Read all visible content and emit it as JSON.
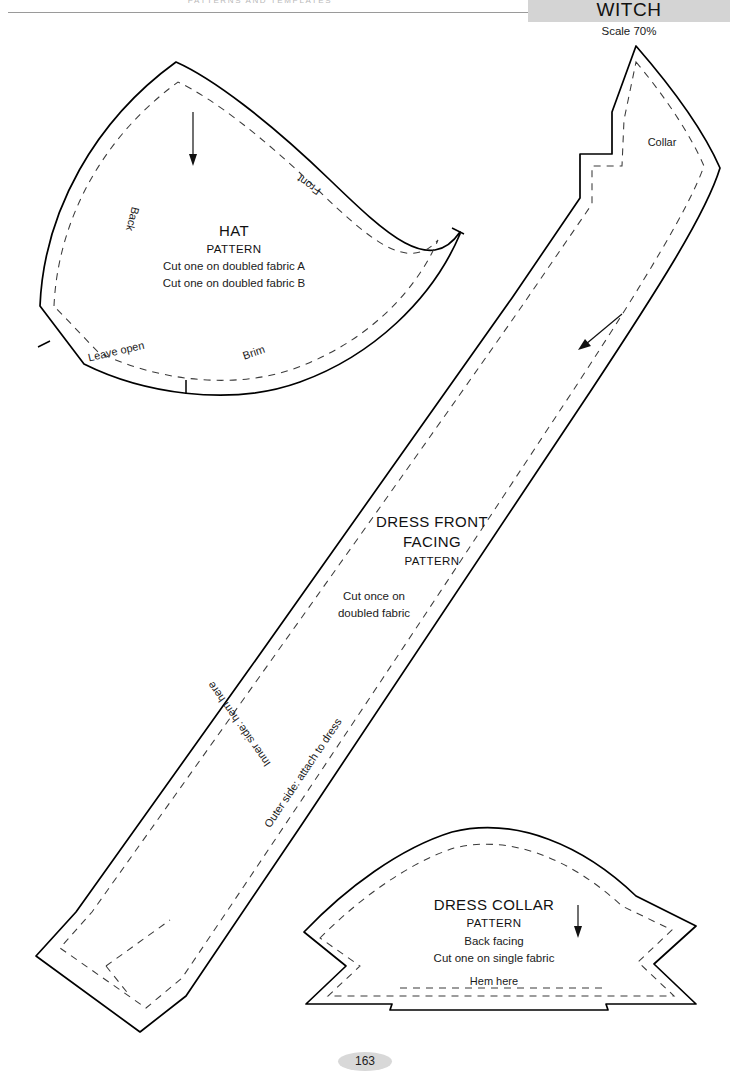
{
  "page": {
    "running_head": "PATTERNS AND TEMPLATES",
    "folio": "163"
  },
  "banner": {
    "title": "WITCH",
    "scale": "Scale 70%",
    "color": "#d4d4d4"
  },
  "pieces": {
    "hat": {
      "title": "HAT",
      "subtitle": "PATTERN",
      "line1": "Cut one on doubled fabric A",
      "line2": "Cut one on doubled fabric B",
      "edge_back": "Back",
      "edge_front": "Front",
      "edge_leave_open": "Leave open",
      "edge_brim": "Brim"
    },
    "dress_front_facing": {
      "title_line1": "DRESS FRONT",
      "title_line2": "FACING",
      "subtitle": "PATTERN",
      "line1": "Cut once on",
      "line2": "doubled fabric",
      "edge_inner": "Inner side: hem here",
      "edge_outer": "Outer side: attach to dress",
      "edge_collar": "Collar"
    },
    "dress_collar": {
      "title": "DRESS COLLAR",
      "subtitle": "PATTERN",
      "line1": "Back facing",
      "line2": "Cut one on single fabric",
      "edge_hem": "Hem here"
    }
  }
}
